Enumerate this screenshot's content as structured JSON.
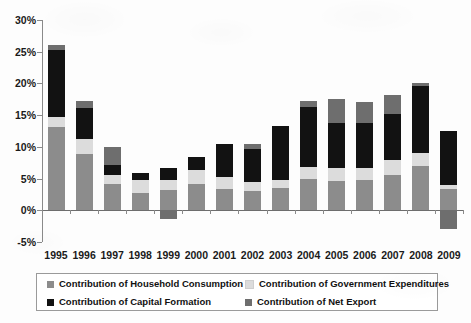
{
  "chart_data": {
    "type": "bar",
    "stacked": true,
    "title": "",
    "subtitle": "",
    "xlabel": "",
    "ylabel": "",
    "ylim": [
      -5,
      30
    ],
    "ytick_labels": [
      "30%",
      "25%",
      "20%",
      "15%",
      "10%",
      "5%",
      "0%",
      "-5%"
    ],
    "ytick_values": [
      30,
      25,
      20,
      15,
      10,
      5,
      0,
      -5
    ],
    "grid": false,
    "legend_position": "bottom",
    "categories": [
      "1995",
      "1996",
      "1997",
      "1998",
      "1999",
      "2000",
      "2001",
      "2002",
      "2003",
      "2004",
      "2005",
      "2006",
      "2007",
      "2008",
      "2009"
    ],
    "series": [
      {
        "name": "Contribution of Household Consumption",
        "color": "#8c8c8c",
        "values": [
          13.1,
          8.9,
          4.1,
          2.8,
          3.2,
          4.2,
          3.4,
          3.1,
          3.5,
          5.0,
          4.6,
          4.7,
          5.6,
          7.0,
          3.4
        ]
      },
      {
        "name": "Contribution of Government Expenditures",
        "color": "#dcdcdc",
        "values": [
          1.6,
          2.3,
          1.5,
          1.9,
          1.5,
          2.2,
          1.9,
          1.3,
          1.3,
          1.9,
          2.0,
          2.0,
          2.4,
          2.1,
          0.6
        ]
      },
      {
        "name": "Contribution of Capital Formation",
        "color": "#121212",
        "values": [
          10.6,
          5.0,
          1.5,
          1.2,
          1.9,
          2.0,
          5.1,
          5.3,
          8.5,
          9.4,
          7.1,
          7.0,
          7.2,
          10.5,
          8.5
        ]
      },
      {
        "name": "Contribution of Net Export",
        "color": "#6e6e6e",
        "values": [
          0.7,
          1.0,
          2.9,
          0.0,
          -1.4,
          0.0,
          0.0,
          0.7,
          0.0,
          1.0,
          3.9,
          3.3,
          3.0,
          0.4,
          -3.0
        ]
      }
    ],
    "legend": [
      {
        "label": "Contribution of Household Consumption",
        "color": "#8c8c8c"
      },
      {
        "label": "Contribution of Government Expenditures",
        "color": "#dcdcdc"
      },
      {
        "label": "Contribution of Capital Formation",
        "color": "#121212"
      },
      {
        "label": "Contribution of Net Export",
        "color": "#6e6e6e"
      }
    ]
  }
}
